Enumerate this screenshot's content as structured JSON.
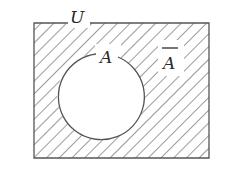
{
  "diagram": {
    "type": "venn",
    "universal_set_label": "U",
    "set_label": "A",
    "complement_label": "A",
    "complement_has_overbar": true,
    "shaded_region": "complement of A",
    "colors": {
      "stroke": "#555555",
      "hatch": "#666666",
      "background": "#ffffff"
    }
  }
}
